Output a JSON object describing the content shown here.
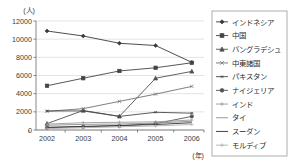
{
  "chart_data": {
    "type": "line",
    "title": "",
    "xlabel": "(年)",
    "ylabel": "(人)",
    "ylim": [
      0,
      12000
    ],
    "ytick_values": [
      0,
      2000,
      4000,
      6000,
      8000,
      10000,
      12000
    ],
    "ytick_labels": [
      "0",
      "2000",
      "4000",
      "6000",
      "8000",
      "10000",
      "12000"
    ],
    "categories": [
      "2002",
      "2003",
      "2004",
      "2005",
      "2006"
    ],
    "grid": true,
    "legend_position": "right",
    "series": [
      {
        "name": "インドネシア",
        "marker": "diamond",
        "color": "#3a3a3a",
        "values": [
          10900,
          10350,
          9550,
          9300,
          7450
        ]
      },
      {
        "name": "中国",
        "marker": "square",
        "color": "#444444",
        "values": [
          4870,
          5700,
          6500,
          6850,
          7400
        ]
      },
      {
        "name": "バングラデシュ",
        "marker": "triangle",
        "color": "#4f4f4f",
        "values": [
          700,
          2150,
          1500,
          5700,
          6450
        ]
      },
      {
        "name": "中東諸国",
        "marker": "cross",
        "color": "#707070",
        "values": [
          2050,
          2350,
          3150,
          3950,
          4800
        ]
      },
      {
        "name": "パキスタン",
        "marker": "star",
        "color": "#4a4a4a",
        "values": [
          2100,
          2100,
          1500,
          1950,
          1850
        ]
      },
      {
        "name": "ナイジェリア",
        "marker": "circle",
        "color": "#555555",
        "values": [
          250,
          350,
          450,
          700,
          1500
        ]
      },
      {
        "name": "インド",
        "marker": "plus",
        "color": "#9b9b9b",
        "values": [
          650,
          800,
          850,
          900,
          1100
        ]
      },
      {
        "name": "タイ",
        "marker": "none",
        "color": "#8d8d8d",
        "values": [
          520,
          620,
          660,
          760,
          960
        ]
      },
      {
        "name": "スーダン",
        "marker": "none",
        "color": "#303030",
        "values": [
          300,
          400,
          500,
          600,
          800
        ]
      },
      {
        "name": "モルディブ",
        "marker": "plus",
        "color": "#b0b0b0",
        "values": [
          150,
          250,
          350,
          450,
          600
        ]
      }
    ]
  }
}
